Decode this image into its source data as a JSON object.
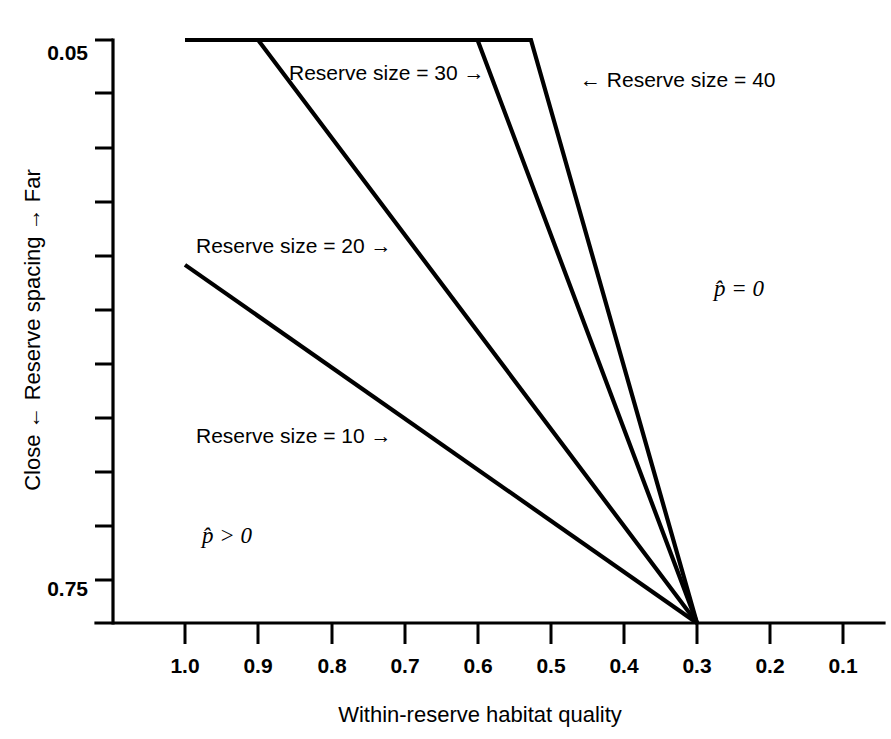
{
  "chart_data": {
    "type": "line",
    "title": "",
    "xlabel": "Within-reserve habitat quality",
    "ylabel": "Close ← Reserve spacing → Far",
    "xlim": [
      1.05,
      0.05
    ],
    "ylim": [
      0.05,
      0.78
    ],
    "x_axis_reversed": true,
    "y_axis_reversed": true,
    "grid": false,
    "legend": "inline-annotations",
    "xticks": [
      "1.0",
      "0.9",
      "0.8",
      "0.7",
      "0.6",
      "0.5",
      "0.4",
      "0.3",
      "0.2",
      "0.1"
    ],
    "xtick_values": [
      1.0,
      0.9,
      0.8,
      0.7,
      0.6,
      0.5,
      0.4,
      0.3,
      0.2,
      0.1
    ],
    "yticks_labeled": [
      "0.05",
      "0.75"
    ],
    "ytick_values": [
      0.05,
      0.75
    ],
    "ytick_minor_count": 9,
    "series": [
      {
        "name": "Reserve size = 10",
        "label": "Reserve size = 10 →",
        "x": [
          1.0,
          0.3
        ],
        "y": [
          0.32,
          0.75
        ],
        "has_plateau": false
      },
      {
        "name": "Reserve size = 20",
        "label": "Reserve size = 20 →",
        "x": [
          1.0,
          0.9,
          0.3
        ],
        "y": [
          0.05,
          0.05,
          0.75
        ],
        "has_plateau": true,
        "plateau_end_x": 0.9
      },
      {
        "name": "Reserve size = 30",
        "label": "Reserve size = 30 →",
        "x": [
          1.0,
          0.6,
          0.3
        ],
        "y": [
          0.05,
          0.05,
          0.75
        ],
        "has_plateau": true,
        "plateau_end_x": 0.6
      },
      {
        "name": "Reserve size = 40",
        "label": "← Reserve size = 40",
        "x": [
          1.0,
          0.527,
          0.3
        ],
        "y": [
          0.05,
          0.05,
          0.75
        ],
        "has_plateau": true,
        "plateau_end_x": 0.527
      }
    ],
    "annotations": [
      {
        "name": "p-hat-equals-zero",
        "text": "p̂ = 0",
        "x": 0.34,
        "y": 0.285
      },
      {
        "name": "p-hat-greater-zero",
        "text": "p̂ > 0",
        "x": 0.87,
        "y": 0.6
      }
    ]
  },
  "axes": {
    "x_title": "Within-reserve habitat quality",
    "y_title": "Close ← Reserve spacing → Far",
    "xticks": {
      "t0": "1.0",
      "t1": "0.9",
      "t2": "0.8",
      "t3": "0.7",
      "t4": "0.6",
      "t5": "0.5",
      "t6": "0.4",
      "t7": "0.3",
      "t8": "0.2",
      "t9": "0.1"
    },
    "yticks": {
      "top": "0.05",
      "bottom": "0.75"
    }
  },
  "labels": {
    "size10": "Reserve size = 10 →",
    "size20": "Reserve size = 20 →",
    "size30": "Reserve size = 30 →",
    "size40": "← Reserve size = 40",
    "p_equals_zero": "p̂ = 0",
    "p_greater_zero": "p̂ > 0"
  },
  "colors": {
    "background": "#ffffff",
    "ink": "#000000"
  }
}
